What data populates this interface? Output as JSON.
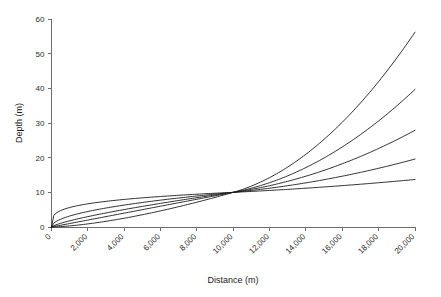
{
  "chart_data": {
    "type": "line",
    "title": "",
    "xlabel": "Distance (m)",
    "ylabel": "Depth (m)",
    "xlim": [
      0,
      20000
    ],
    "ylim": [
      0,
      60
    ],
    "grid": false,
    "legend": "none",
    "x_ticks": [
      0,
      2000,
      4000,
      6000,
      8000,
      10000,
      12000,
      14000,
      16000,
      18000,
      20000
    ],
    "x_tick_labels": [
      "0",
      "2,000",
      "4,000",
      "6,000",
      "8,000",
      "10,000",
      "12,000",
      "14,000",
      "16,000",
      "18,000",
      "20,000"
    ],
    "x_tick_label_rotation": -45,
    "y_ticks": [
      0,
      10,
      20,
      30,
      40,
      50,
      60
    ],
    "y_tick_labels": [
      "0",
      "10",
      "20",
      "30",
      "40",
      "50",
      "60"
    ],
    "convergence_point": {
      "x": 10000,
      "y": 10
    },
    "x": [
      0,
      500,
      1000,
      1500,
      2000,
      3000,
      4000,
      5000,
      6000,
      7000,
      8000,
      9000,
      10000,
      11000,
      12000,
      13000,
      14000,
      15000,
      16000,
      17000,
      18000,
      19000,
      20000
    ],
    "series": [
      {
        "name": "curve-1-shallow",
        "exponent": 0.25,
        "end_value": 13.7,
        "values": [
          0,
          3.4,
          4.0,
          4.4,
          4.7,
          5.2,
          5.6,
          5.9,
          6.2,
          6.5,
          6.7,
          6.9,
          10.0,
          10.7,
          11.1,
          11.5,
          11.8,
          12.2,
          12.5,
          12.8,
          13.1,
          13.4,
          13.7
        ]
      },
      {
        "name": "curve-2",
        "exponent": 0.5,
        "end_value": 19.6,
        "values": [
          0,
          2.2,
          3.2,
          3.9,
          4.5,
          5.5,
          6.3,
          7.1,
          7.7,
          8.4,
          8.9,
          9.5,
          10.0,
          11.3,
          12.2,
          13.0,
          13.8,
          14.5,
          15.1,
          15.8,
          16.4,
          17.0,
          19.6
        ]
      },
      {
        "name": "curve-3",
        "exponent": 0.75,
        "end_value": 27.9,
        "values": [
          0,
          1.1,
          1.8,
          2.4,
          3.0,
          4.1,
          5.0,
          5.9,
          6.8,
          7.6,
          8.3,
          9.1,
          10.0,
          11.6,
          13.0,
          14.3,
          15.6,
          16.8,
          18.0,
          19.2,
          20.3,
          21.4,
          27.9
        ]
      },
      {
        "name": "curve-4",
        "exponent": 1.0,
        "end_value": 39.7,
        "values": [
          0,
          0.5,
          1.0,
          1.5,
          2.0,
          3.0,
          4.0,
          5.0,
          6.0,
          7.0,
          8.0,
          9.0,
          10.0,
          12.2,
          14.3,
          16.3,
          18.2,
          20.1,
          22.0,
          23.8,
          25.6,
          27.3,
          39.7
        ]
      },
      {
        "name": "curve-5-steep",
        "exponent": 1.5,
        "end_value": 56.2,
        "values": [
          0,
          0.1,
          0.3,
          0.6,
          0.9,
          1.6,
          2.5,
          3.5,
          4.6,
          5.9,
          7.2,
          8.5,
          10.0,
          13.0,
          16.2,
          19.6,
          23.1,
          26.8,
          30.6,
          34.5,
          38.5,
          42.7,
          56.2
        ]
      }
    ]
  }
}
